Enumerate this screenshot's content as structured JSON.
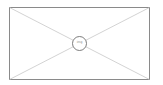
{
  "image_placeholder": {
    "icon": "image-placeholder-icon",
    "label": "img",
    "frame_color": "#8a8a8a",
    "diagonal_color": "#c8c8c8",
    "circle_color": "#6e6e6e"
  }
}
